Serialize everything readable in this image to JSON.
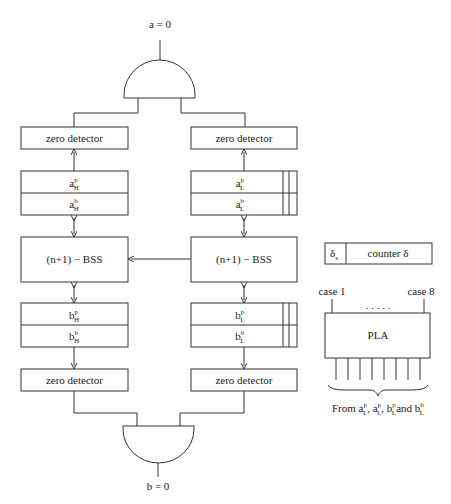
{
  "diagram": {
    "top_output": {
      "label": "a = 0"
    },
    "bottom_output": {
      "label": "b = 0"
    },
    "left_column": {
      "zero_detector_top": "zero detector",
      "a_register": {
        "row1": {
          "base": "a",
          "sup": "p",
          "sub": "H"
        },
        "row2": {
          "base": "a",
          "sup": "b",
          "sub": "H"
        }
      },
      "bss": "(n+1) − BSS",
      "b_register": {
        "row1": {
          "base": "b",
          "sup": "p",
          "sub": "H"
        },
        "row2": {
          "base": "b",
          "sup": "b",
          "sub": "H"
        }
      },
      "zero_detector_bottom": "zero detector"
    },
    "right_column": {
      "zero_detector_top": "zero detector",
      "a_register": {
        "row1": {
          "base": "a",
          "sup": "p",
          "sub": "L"
        },
        "row2": {
          "base": "a",
          "sup": "b",
          "sub": "L"
        }
      },
      "bss": "(n+1) − BSS",
      "b_register": {
        "row1": {
          "base": "b",
          "sup": "p",
          "sub": "L"
        },
        "row2": {
          "base": "b",
          "sup": "b",
          "sub": "L"
        }
      },
      "zero_detector_bottom": "zero detector"
    },
    "counter": {
      "cell_base": "δ",
      "cell_sub": "s",
      "label": "counter δ"
    },
    "pla": {
      "label": "PLA",
      "case_first": "case 1",
      "case_last": "case 8",
      "dots": ". . . . .",
      "input_count": 8,
      "caption": {
        "prefix": "From ",
        "terms": [
          {
            "base": "a",
            "sup": "p",
            "sub": "L"
          },
          {
            "base": "a",
            "sup": "p",
            "sub": "L"
          },
          {
            "base": "b",
            "sup": "p",
            "sub": "L"
          },
          {
            "base": "b",
            "sup": "b",
            "sub": "L"
          }
        ],
        "sep1": ", ",
        "sep2": ", ",
        "sep3": "and "
      }
    }
  }
}
